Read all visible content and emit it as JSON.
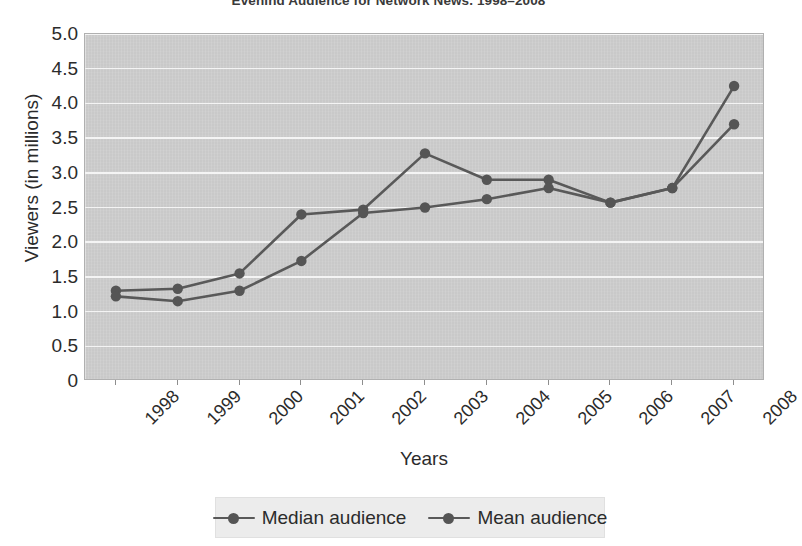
{
  "chart_data": {
    "type": "line",
    "title": "Evening Audience for Network News, 1998–2008",
    "xlabel": "Years",
    "ylabel": "Viewers (in millions)",
    "categories": [
      "1998",
      "1999",
      "2000",
      "2001",
      "2002",
      "2003",
      "2004",
      "2005",
      "2006",
      "2007",
      "2008"
    ],
    "ytick_labels": [
      "0",
      "0.5",
      "1.0",
      "1.5",
      "2.0",
      "2.5",
      "3.0",
      "3.5",
      "4.0",
      "4.5",
      "5.0"
    ],
    "ytick_values": [
      0,
      0.5,
      1.0,
      1.5,
      2.0,
      2.5,
      3.0,
      3.5,
      4.0,
      4.5,
      5.0
    ],
    "ylim": [
      0,
      5.0
    ],
    "grid": "horizontal",
    "legend_position": "bottom",
    "series": [
      {
        "name": "Median audience",
        "color": "#595959",
        "values": [
          1.3,
          1.33,
          1.55,
          2.4,
          2.47,
          3.28,
          2.9,
          2.9,
          2.57,
          2.78,
          4.25
        ]
      },
      {
        "name": "Mean audience",
        "color": "#595959",
        "values": [
          1.22,
          1.15,
          1.3,
          1.73,
          2.42,
          2.5,
          2.62,
          2.78,
          2.57,
          2.78,
          3.7
        ]
      }
    ],
    "colors": {
      "plot_background": "#c9c9c9",
      "gridline": "#f4f4f4",
      "line": "#595959",
      "marker": "#555555",
      "legend_background": "#ececec",
      "text": "#2b2b2b"
    }
  }
}
